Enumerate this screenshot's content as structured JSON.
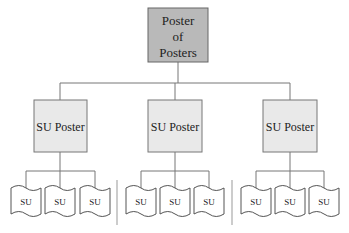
{
  "diagram": {
    "root": {
      "label_lines": [
        "Poster",
        "of",
        "Posters"
      ],
      "fill": "#b9b9b9"
    },
    "children": [
      {
        "label": "SU Poster",
        "fill": "#e9e9e9",
        "leaves": [
          "SU",
          "SU",
          "SU"
        ]
      },
      {
        "label": "SU Poster",
        "fill": "#e9e9e9",
        "leaves": [
          "SU",
          "SU",
          "SU"
        ]
      },
      {
        "label": "SU Poster",
        "fill": "#e9e9e9",
        "leaves": [
          "SU",
          "SU",
          "SU"
        ]
      }
    ],
    "line_color": "#777777"
  }
}
